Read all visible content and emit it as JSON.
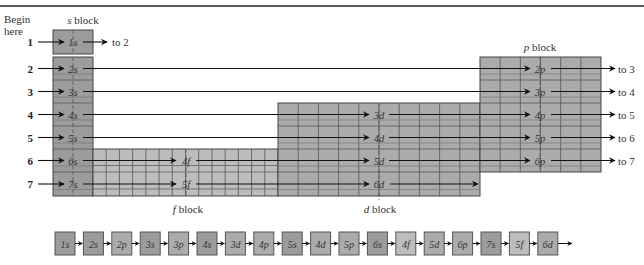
{
  "figure": {
    "caption_partial": "Figure 5-10",
    "begin_label_line1": "Begin",
    "begin_label_line2": "here"
  },
  "blocks": {
    "s": {
      "label_italic": "s",
      "label_rest": " block",
      "color": "#9c9c9c"
    },
    "p": {
      "label_italic": "p",
      "label_rest": " block",
      "color": "#ababab"
    },
    "d": {
      "label_italic": "d",
      "label_rest": " block",
      "color": "#ababab"
    },
    "f": {
      "label_italic": "f",
      "label_rest": " block",
      "color": "#bdbdbd"
    }
  },
  "rows": [
    {
      "n": "1",
      "entries": [
        "1s"
      ],
      "exit": "to 2"
    },
    {
      "n": "2",
      "entries": [
        "2s",
        "2p"
      ],
      "exit": "to 3"
    },
    {
      "n": "3",
      "entries": [
        "3s",
        "3p"
      ],
      "exit": "to 4"
    },
    {
      "n": "4",
      "entries": [
        "4s",
        "3d",
        "4p"
      ],
      "exit": "to 5"
    },
    {
      "n": "5",
      "entries": [
        "5s",
        "4d",
        "5p"
      ],
      "exit": "to 6"
    },
    {
      "n": "6",
      "entries": [
        "6s",
        "4f",
        "5d",
        "6p"
      ],
      "exit": "to 7"
    },
    {
      "n": "7",
      "entries": [
        "7s",
        "5f",
        "6d"
      ],
      "exit": ""
    }
  ],
  "sequence": [
    {
      "label": "1s",
      "block": "s"
    },
    {
      "label": "2s",
      "block": "s"
    },
    {
      "label": "2p",
      "block": "p"
    },
    {
      "label": "3s",
      "block": "s"
    },
    {
      "label": "3p",
      "block": "p"
    },
    {
      "label": "4s",
      "block": "s"
    },
    {
      "label": "3d",
      "block": "d"
    },
    {
      "label": "4p",
      "block": "p"
    },
    {
      "label": "5s",
      "block": "s"
    },
    {
      "label": "4d",
      "block": "d"
    },
    {
      "label": "5p",
      "block": "p"
    },
    {
      "label": "6s",
      "block": "s"
    },
    {
      "label": "4f",
      "block": "f"
    },
    {
      "label": "5d",
      "block": "d"
    },
    {
      "label": "6p",
      "block": "p"
    },
    {
      "label": "7s",
      "block": "s"
    },
    {
      "label": "5f",
      "block": "f"
    },
    {
      "label": "6d",
      "block": "d"
    }
  ]
}
